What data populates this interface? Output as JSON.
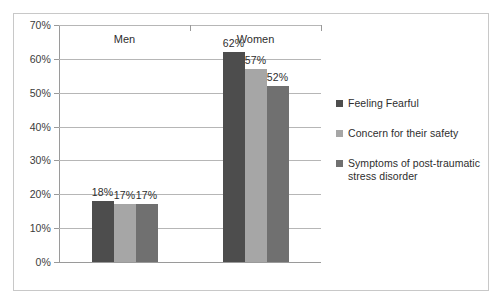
{
  "chart_data": {
    "type": "bar",
    "title": "",
    "xlabel": "",
    "ylabel": "",
    "categories": [
      "Men",
      "Women"
    ],
    "series": [
      {
        "name": "Feeling Fearful",
        "color": "#4d4d4d",
        "values": [
          18,
          57
        ],
        "labels": [
          "18%",
          "62%"
        ]
      },
      {
        "name": "Concern for their safety",
        "color": "#a6a6a6",
        "values": [
          17,
          57
        ],
        "labels": [
          "17%",
          "57%"
        ]
      },
      {
        "name": "Symptoms of post-traumatic stress disorder",
        "color": "#707070",
        "values": [
          17,
          52
        ],
        "labels": [
          "17%",
          "52%"
        ]
      }
    ],
    "data": {
      "Men": {
        "Feeling Fearful": 18,
        "Concern for their safety": 17,
        "Symptoms of post-traumatic stress disorder": 17
      },
      "Women": {
        "Feeling Fearful": 62,
        "Concern for their safety": 57,
        "Symptoms of post-traumatic stress disorder": 52
      }
    },
    "ylim": [
      0,
      70
    ],
    "ytick_values": [
      0,
      10,
      20,
      30,
      40,
      50,
      60,
      70
    ],
    "ytick_labels": [
      "0%",
      "10%",
      "20%",
      "30%",
      "40%",
      "50%",
      "60%",
      "70%"
    ],
    "grid": true,
    "legend_position": "right",
    "value_labels_shown": true
  },
  "legend": {
    "items": [
      {
        "label": "Feeling Fearful"
      },
      {
        "label": "Concern for their safety"
      },
      {
        "label": "Symptoms of post-traumatic stress disorder"
      }
    ]
  },
  "axis": {
    "y_labels": [
      "70%",
      "60%",
      "50%",
      "40%",
      "30%",
      "20%",
      "10%",
      "0%"
    ],
    "x_labels": [
      "Men",
      "Women"
    ]
  },
  "bar_labels": {
    "men": [
      "18%",
      "17%",
      "17%"
    ],
    "women": [
      "62%",
      "57%",
      "52%"
    ]
  }
}
